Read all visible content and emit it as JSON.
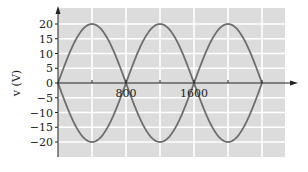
{
  "chart_data": {
    "type": "line",
    "title": "",
    "xlabel": "",
    "ylabel": "v (V)",
    "xlim": [
      0,
      2800
    ],
    "ylim": [
      -25,
      25
    ],
    "grid": true,
    "legend": null,
    "x_tick_labels": [
      {
        "value": 800,
        "label": "800"
      },
      {
        "value": 1600,
        "label": "1600"
      }
    ],
    "y_ticks": [
      20,
      15,
      10,
      5,
      0,
      -5,
      -10,
      -15,
      -20
    ],
    "y_tick_labels": [
      "20",
      "15",
      "10",
      "5",
      "0",
      "−5",
      "−10",
      "−15",
      "−20"
    ],
    "x_grid": [
      400,
      800,
      1200,
      1600,
      2000,
      2400
    ],
    "series": [
      {
        "name": "positive arches (|v|)",
        "description": "Rectified sinusoid, amplitude 20 V, zeros every 800 units",
        "x": [
          0,
          200,
          400,
          600,
          800,
          1000,
          1200,
          1400,
          1600,
          1800,
          2000,
          2200,
          2400
        ],
        "values": [
          0,
          14.1,
          20,
          14.1,
          0,
          14.1,
          20,
          14.1,
          0,
          14.1,
          20,
          14.1,
          0
        ]
      },
      {
        "name": "negative arches (-|v|)",
        "description": "Mirror of rectified sinusoid, amplitude -20 V",
        "x": [
          0,
          200,
          400,
          600,
          800,
          1000,
          1200,
          1400,
          1600,
          1800,
          2000,
          2200,
          2400
        ],
        "values": [
          0,
          -14.1,
          -20,
          -14.1,
          0,
          -14.1,
          -20,
          -14.1,
          0,
          -14.1,
          -20,
          -14.1,
          0
        ]
      }
    ],
    "colors": {
      "plot_background": "#dcdcdc",
      "grid": "#ffffff",
      "curve": "#6e6e6e",
      "axis": "#222222"
    }
  }
}
